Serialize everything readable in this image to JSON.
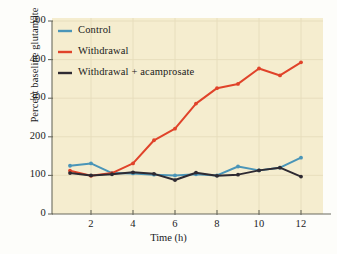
{
  "chart_data": {
    "type": "line",
    "title": "",
    "xlabel": "Time (h)",
    "ylabel": "Percent baseline glutamate",
    "xlim": [
      0,
      13
    ],
    "ylim": [
      0,
      500
    ],
    "xticks": [
      2,
      4,
      6,
      8,
      10,
      12
    ],
    "yticks": [
      0,
      100,
      200,
      300,
      400,
      500
    ],
    "xtick_labels": [
      "2",
      "4",
      "6",
      "8",
      "10",
      "12"
    ],
    "ytick_labels": [
      "0",
      "100",
      "200",
      "300",
      "400",
      "500"
    ],
    "grid": true,
    "legend_position": "upper left",
    "x": [
      1,
      2,
      3,
      4,
      5,
      6,
      7,
      8,
      9,
      10,
      11,
      12
    ],
    "series": [
      {
        "name": "Control",
        "color": "#4a95b8",
        "values": [
          125,
          131,
          106,
          105,
          102,
          100,
          103,
          100,
          123,
          113,
          120,
          146
        ]
      },
      {
        "name": "Withdrawal",
        "color": "#e0432a",
        "values": [
          112,
          99,
          106,
          131,
          191,
          221,
          286,
          326,
          337,
          377,
          359,
          393
        ]
      },
      {
        "name": "Withdrawal + acamprosate",
        "color": "#2e2a32",
        "values": [
          106,
          100,
          103,
          108,
          104,
          88,
          107,
          99,
          102,
          113,
          120,
          97
        ]
      }
    ]
  },
  "plot": {
    "background_color": "#f5edcf",
    "grid_color": "#e6dcbb",
    "axis_color": "#6b6b5e"
  }
}
